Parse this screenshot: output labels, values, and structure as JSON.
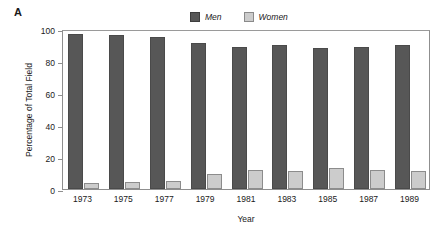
{
  "panel": {
    "label": "A"
  },
  "legend": {
    "position": "top-center",
    "entries": [
      {
        "label": "Men",
        "color": "#575757",
        "icon": "legend-swatch-men"
      },
      {
        "label": "Women",
        "color": "#cccccc",
        "icon": "legend-swatch-women"
      }
    ]
  },
  "axes": {
    "y": {
      "title": "Percentage of Total Field",
      "ticks": [
        "0",
        "20",
        "40",
        "60",
        "80",
        "100"
      ]
    },
    "x": {
      "title": "Year",
      "ticks": [
        "1973",
        "1975",
        "1977",
        "1979",
        "1981",
        "1983",
        "1985",
        "1987",
        "1989"
      ]
    }
  },
  "chart_data": {
    "type": "bar",
    "title": "",
    "subtitle": "",
    "xlabel": "Year",
    "ylabel": "Percentage of Total Field",
    "categories": [
      "1973",
      "1975",
      "1977",
      "1979",
      "1981",
      "1983",
      "1985",
      "1987",
      "1989"
    ],
    "series": [
      {
        "name": "Men",
        "color": "#575757",
        "values": [
          97,
          96,
          95,
          91,
          89,
          90,
          88,
          89,
          90
        ]
      },
      {
        "name": "Women",
        "color": "#cccccc",
        "values": [
          4,
          4.5,
          5,
          9.5,
          12,
          11,
          13,
          12,
          11.5
        ]
      }
    ],
    "ylim": [
      0,
      100
    ],
    "yticks": [
      0,
      20,
      40,
      60,
      80,
      100
    ],
    "grid": false,
    "legend_position": "top-center",
    "panel_label": "A"
  }
}
